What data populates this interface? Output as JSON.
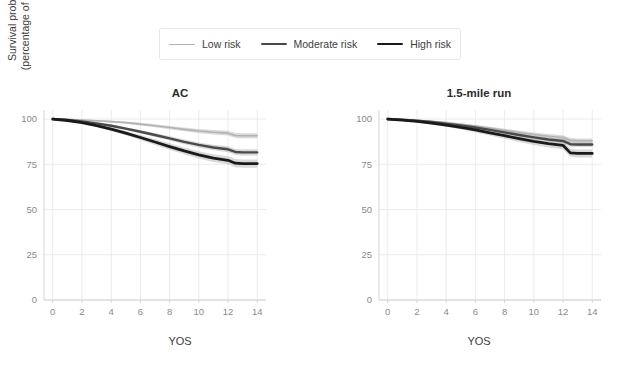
{
  "legend": {
    "position": "top-center",
    "items": [
      {
        "label": "Low risk",
        "color": "#b3b3b3",
        "width": 1.6,
        "name": "legend-item-low-risk"
      },
      {
        "label": "Moderate risk",
        "color": "#4a4a4a",
        "width": 2.4,
        "name": "legend-item-moderate-risk"
      },
      {
        "label": "High risk",
        "color": "#1a1a1a",
        "width": 2.8,
        "name": "legend-item-high-risk"
      }
    ]
  },
  "axis": {
    "xlabel": "YOS",
    "ylabel": "Survival probability\n(percentage of airmen)",
    "xticks": [
      0,
      2,
      4,
      6,
      8,
      10,
      12,
      14
    ],
    "yticks": [
      0,
      25,
      50,
      75,
      100
    ],
    "xlim": [
      -0.6,
      14.6
    ],
    "ylim": [
      0,
      105
    ],
    "grid": true
  },
  "chart_data": {
    "type": "line",
    "title": "",
    "xlabel": "YOS",
    "ylabel": "Survival probability (percentage of airmen)",
    "xlim": [
      -0.6,
      14.6
    ],
    "ylim": [
      0,
      105
    ],
    "xticks": [
      0,
      2,
      4,
      6,
      8,
      10,
      12,
      14
    ],
    "yticks": [
      0,
      25,
      50,
      75,
      100
    ],
    "grid": true,
    "legend": [
      "Low risk",
      "Moderate risk",
      "High risk"
    ],
    "legend_position": "top-center",
    "panels": [
      {
        "name": "AC",
        "title": "AC",
        "x": [
          0,
          1,
          2,
          3,
          4,
          5,
          6,
          7,
          8,
          9,
          10,
          11,
          12,
          12.5,
          13,
          14
        ],
        "series": [
          {
            "name": "Low risk",
            "color": "#b3b3b3",
            "width": 1.6,
            "values": [
              100,
              99.8,
              99.5,
              99.1,
              98.6,
              98.0,
              97.2,
              96.3,
              95.3,
              94.3,
              93.4,
              92.7,
              92.2,
              90.9,
              90.8,
              90.8
            ],
            "band_low": [
              100,
              99.6,
              99.2,
              98.7,
              98.1,
              97.4,
              96.5,
              95.5,
              94.4,
              93.3,
              92.3,
              91.5,
              90.9,
              89.5,
              89.4,
              89.4
            ],
            "band_high": [
              100,
              100,
              99.8,
              99.5,
              99.1,
              98.6,
              97.9,
              97.1,
              96.2,
              95.3,
              94.5,
              93.9,
              93.5,
              92.3,
              92.2,
              92.2
            ]
          },
          {
            "name": "Moderate risk",
            "color": "#4a4a4a",
            "width": 2.4,
            "values": [
              100,
              99.5,
              98.7,
              97.6,
              96.3,
              94.7,
              93.0,
              91.2,
              89.3,
              87.4,
              85.7,
              84.3,
              83.3,
              81.8,
              81.6,
              81.6
            ],
            "band_low": [
              100,
              99.3,
              98.3,
              97.1,
              95.6,
              93.9,
              92.0,
              90.1,
              88.1,
              86.1,
              84.3,
              82.8,
              81.7,
              80.1,
              79.9,
              79.9
            ],
            "band_high": [
              100,
              99.7,
              99.1,
              98.1,
              97.0,
              95.5,
              94.0,
              92.3,
              90.5,
              88.7,
              87.1,
              85.8,
              84.9,
              83.5,
              83.3,
              83.3
            ]
          },
          {
            "name": "High risk",
            "color": "#1a1a1a",
            "width": 2.8,
            "values": [
              100,
              99.2,
              98.0,
              96.4,
              94.4,
              92.2,
              89.8,
              87.3,
              84.8,
              82.4,
              80.2,
              78.4,
              77.2,
              75.6,
              75.4,
              75.4
            ],
            "band_low": [
              100,
              98.9,
              97.5,
              95.6,
              93.4,
              91.0,
              88.4,
              85.7,
              83.0,
              80.5,
              78.2,
              76.3,
              75.0,
              73.3,
              73.1,
              73.1
            ],
            "band_high": [
              100,
              99.5,
              98.5,
              97.2,
              95.4,
              93.4,
              91.2,
              88.9,
              86.6,
              84.3,
              82.2,
              80.5,
              79.4,
              77.9,
              77.7,
              77.7
            ]
          }
        ]
      },
      {
        "name": "1.5-mile run",
        "title": "1.5-mile run",
        "x": [
          0,
          1,
          2,
          3,
          4,
          5,
          6,
          7,
          8,
          9,
          10,
          11,
          12,
          12.5,
          13,
          14
        ],
        "series": [
          {
            "name": "Low risk",
            "color": "#b3b3b3",
            "width": 1.6,
            "values": [
              100,
              99.7,
              99.3,
              98.7,
              98.0,
              97.1,
              96.1,
              95.0,
              93.8,
              92.6,
              91.5,
              90.5,
              89.8,
              88.2,
              88.0,
              88.0
            ],
            "band_low": [
              100,
              99.5,
              99.0,
              98.3,
              97.5,
              96.5,
              95.4,
              94.2,
              92.9,
              91.6,
              90.4,
              89.3,
              88.5,
              86.9,
              86.7,
              86.7
            ],
            "band_high": [
              100,
              99.9,
              99.6,
              99.1,
              98.5,
              97.7,
              96.8,
              95.8,
              94.7,
              93.6,
              92.6,
              91.7,
              91.1,
              89.5,
              89.3,
              89.3
            ]
          },
          {
            "name": "Moderate risk",
            "color": "#4a4a4a",
            "width": 2.4,
            "values": [
              100,
              99.6,
              99.1,
              98.4,
              97.5,
              96.5,
              95.3,
              94.0,
              92.6,
              91.2,
              89.9,
              88.7,
              87.9,
              86.1,
              85.9,
              85.9
            ],
            "band_low": [
              100,
              99.4,
              98.8,
              98.0,
              97.0,
              95.8,
              94.5,
              93.1,
              91.6,
              90.1,
              88.7,
              87.4,
              86.5,
              84.7,
              84.5,
              84.5
            ],
            "band_high": [
              100,
              99.8,
              99.4,
              98.8,
              98.0,
              97.2,
              96.1,
              94.9,
              93.6,
              92.3,
              91.1,
              90.0,
              89.3,
              87.5,
              87.3,
              87.3
            ]
          },
          {
            "name": "High risk",
            "color": "#1a1a1a",
            "width": 2.8,
            "values": [
              100,
              99.4,
              98.7,
              97.8,
              96.7,
              95.4,
              94.0,
              92.4,
              90.8,
              89.2,
              87.7,
              86.4,
              85.5,
              81.3,
              81.0,
              81.0
            ],
            "band_low": [
              100,
              99.1,
              98.2,
              97.1,
              95.8,
              94.3,
              92.6,
              90.9,
              89.1,
              87.3,
              85.7,
              84.3,
              83.3,
              79.1,
              78.8,
              78.8
            ],
            "band_high": [
              100,
              99.7,
              99.2,
              98.5,
              97.6,
              96.5,
              95.4,
              93.9,
              92.5,
              91.1,
              89.7,
              88.5,
              87.7,
              83.5,
              83.2,
              83.2
            ]
          }
        ]
      }
    ]
  }
}
